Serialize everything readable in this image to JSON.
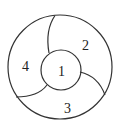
{
  "diagram": {
    "type": "ring-partition",
    "stroke_color": "#333333",
    "background": "#ffffff",
    "regions": [
      {
        "id": "center",
        "label": "1"
      },
      {
        "id": "top-right",
        "label": "2"
      },
      {
        "id": "bottom",
        "label": "3"
      },
      {
        "id": "left",
        "label": "4"
      }
    ]
  }
}
